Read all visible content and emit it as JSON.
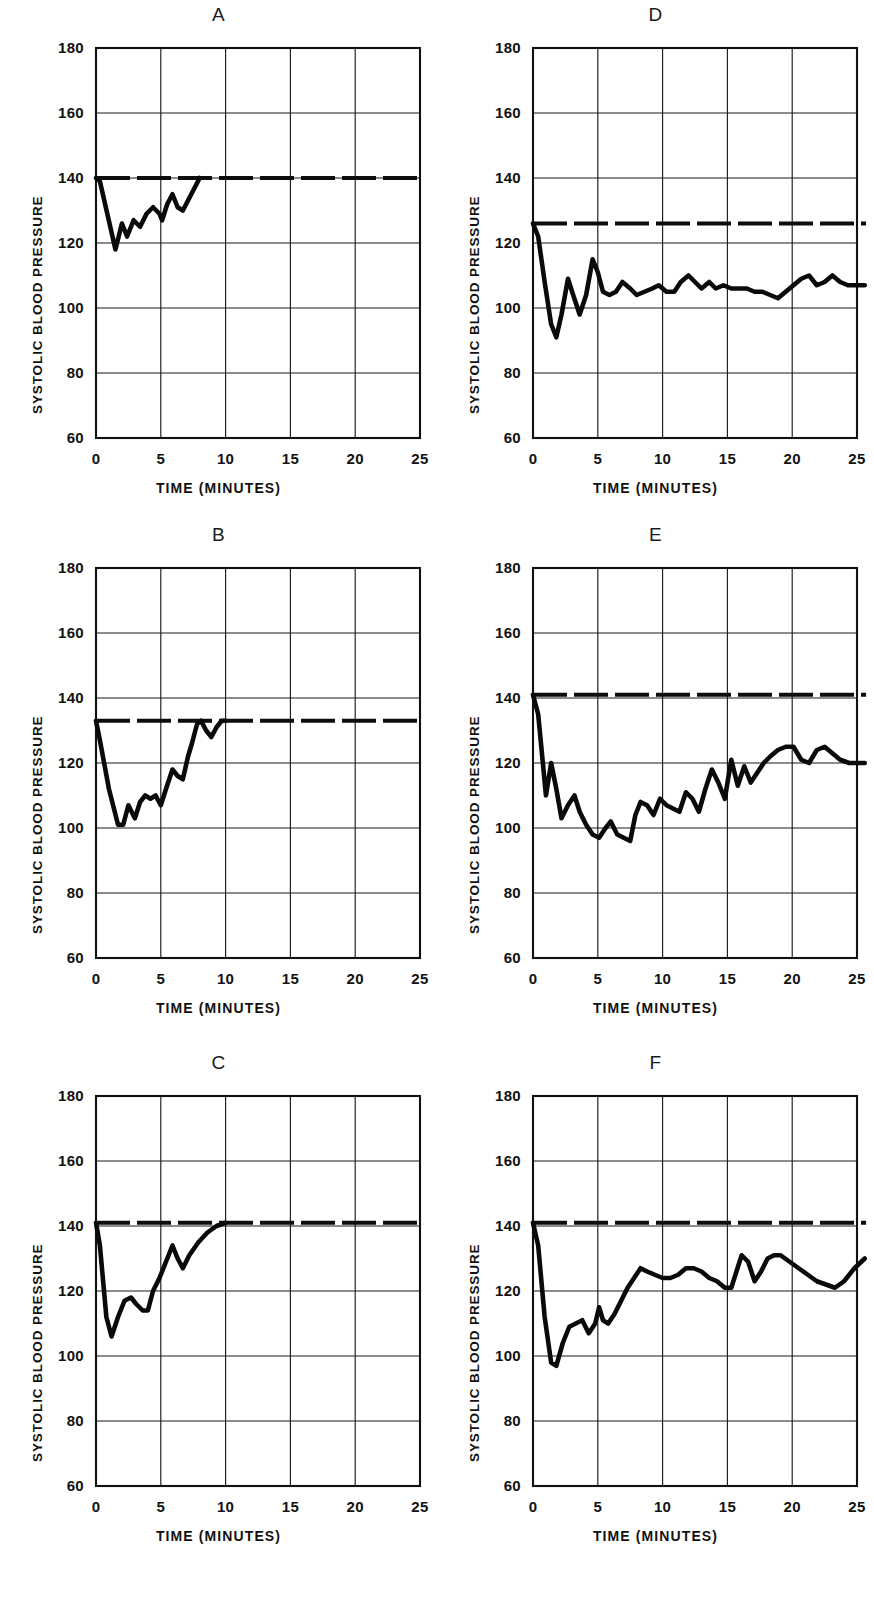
{
  "figure": {
    "title": "",
    "layout": "2 columns x 3 rows",
    "ylabel": "SYSTOLIC BLOOD PRESSURE",
    "xlabel": "TIME  (MINUTES)",
    "yticks": [
      "180",
      "160",
      "140",
      "120",
      "100",
      "80",
      "60"
    ],
    "xticks": [
      "0",
      "5",
      "10",
      "15",
      "20",
      "25"
    ],
    "line_color": "#0a0a0a",
    "grid_color": "#1b1b1b",
    "background": "#ffffff"
  },
  "panels": [
    {
      "id": "A",
      "label": "A",
      "position": "top-left"
    },
    {
      "id": "D",
      "label": "D",
      "position": "top-right"
    },
    {
      "id": "B",
      "label": "B",
      "position": "middle-left"
    },
    {
      "id": "E",
      "label": "E",
      "position": "middle-right"
    },
    {
      "id": "C",
      "label": "C",
      "position": "bottom-left"
    },
    {
      "id": "F",
      "label": "F",
      "position": "bottom-right"
    }
  ],
  "chart_data": [
    {
      "panel": "A",
      "type": "line",
      "title": "A",
      "xlabel": "TIME  (MINUTES)",
      "ylabel": "SYSTOLIC BLOOD PRESSURE",
      "xlim": [
        0,
        25
      ],
      "ylim": [
        60,
        180
      ],
      "xticks": [
        0,
        5,
        10,
        15,
        20,
        25
      ],
      "yticks": [
        60,
        80,
        100,
        120,
        140,
        160,
        180
      ],
      "grid": true,
      "legend": "none",
      "series": [
        {
          "name": "control reference (dashed)",
          "style": "dashed",
          "x": [
            0,
            25
          ],
          "values": [
            140,
            140
          ]
        },
        {
          "name": "systolic blood pressure (solid)",
          "style": "solid",
          "x": [
            0.0,
            0.3,
            1.5,
            2.0,
            2.4,
            2.9,
            3.4,
            3.9,
            4.4,
            4.9,
            5.1,
            5.5,
            5.9,
            6.3,
            6.7,
            8.0
          ],
          "values": [
            140,
            139,
            118,
            126,
            122,
            127,
            125,
            129,
            131,
            129,
            127,
            132,
            135,
            131,
            130,
            140
          ]
        }
      ]
    },
    {
      "panel": "D",
      "type": "line",
      "title": "D",
      "xlabel": "TIME  (MINUTES)",
      "ylabel": "SYSTOLIC BLOOD PRESSURE",
      "xlim": [
        0,
        25.7
      ],
      "ylim": [
        60,
        180
      ],
      "xticks": [
        0,
        5,
        10,
        15,
        20,
        25
      ],
      "yticks": [
        60,
        80,
        100,
        120,
        140,
        160,
        180
      ],
      "grid": true,
      "legend": "none",
      "series": [
        {
          "name": "control reference (dashed)",
          "style": "dashed",
          "x": [
            0,
            25.7
          ],
          "values": [
            126,
            126
          ]
        },
        {
          "name": "systolic blood pressure (solid)",
          "style": "solid",
          "x": [
            0.0,
            0.4,
            0.9,
            1.4,
            1.8,
            2.2,
            2.7,
            3.1,
            3.6,
            4.1,
            4.6,
            5.0,
            5.4,
            5.9,
            6.4,
            6.9,
            7.5,
            8.0,
            8.6,
            9.2,
            9.7,
            10.3,
            10.9,
            11.4,
            12.0,
            12.5,
            13.0,
            13.6,
            14.1,
            14.7,
            15.3,
            15.9,
            16.5,
            17.1,
            17.7,
            18.3,
            18.9,
            19.5,
            20.1,
            20.7,
            21.3,
            21.9,
            22.5,
            23.1,
            23.7,
            24.3,
            24.9,
            25.6
          ],
          "values": [
            126,
            122,
            108,
            95,
            91,
            98,
            109,
            104,
            98,
            104,
            115,
            111,
            105,
            104,
            105,
            108,
            106,
            104,
            105,
            106,
            107,
            105,
            105,
            108,
            110,
            108,
            106,
            108,
            106,
            107,
            106,
            106,
            106,
            105,
            105,
            104,
            103,
            105,
            107,
            109,
            110,
            107,
            108,
            110,
            108,
            107,
            107,
            107
          ]
        }
      ]
    },
    {
      "panel": "B",
      "type": "line",
      "title": "B",
      "xlabel": "TIME  (MINUTES)",
      "ylabel": "SYSTOLIC BLOOD PRESSURE",
      "xlim": [
        0,
        25
      ],
      "ylim": [
        60,
        180
      ],
      "xticks": [
        0,
        5,
        10,
        15,
        20,
        25
      ],
      "yticks": [
        60,
        80,
        100,
        120,
        140,
        160,
        180
      ],
      "grid": true,
      "legend": "none",
      "series": [
        {
          "name": "control reference (dashed)",
          "style": "dashed",
          "x": [
            0,
            25
          ],
          "values": [
            133,
            133
          ]
        },
        {
          "name": "systolic blood pressure (solid)",
          "style": "solid",
          "x": [
            0.0,
            0.3,
            1.0,
            1.7,
            2.1,
            2.5,
            3.0,
            3.4,
            3.8,
            4.2,
            4.6,
            5.0,
            5.4,
            5.9,
            6.3,
            6.7,
            7.1,
            7.4,
            7.8,
            8.1,
            8.5,
            8.9,
            9.3,
            9.7,
            10.0
          ],
          "values": [
            133,
            127,
            112,
            101,
            101,
            107,
            103,
            108,
            110,
            109,
            110,
            107,
            112,
            118,
            116,
            115,
            122,
            126,
            132,
            133,
            130,
            128,
            131,
            133,
            133
          ]
        }
      ]
    },
    {
      "panel": "E",
      "type": "line",
      "title": "E",
      "xlabel": "TIME  (MINUTES)",
      "ylabel": "SYSTOLIC BLOOD PRESSURE",
      "xlim": [
        0,
        25.7
      ],
      "ylim": [
        60,
        180
      ],
      "xticks": [
        0,
        5,
        10,
        15,
        20,
        25
      ],
      "yticks": [
        60,
        80,
        100,
        120,
        140,
        160,
        180
      ],
      "grid": true,
      "legend": "none",
      "series": [
        {
          "name": "control reference (dashed)",
          "style": "dashed",
          "x": [
            0,
            25.7
          ],
          "values": [
            141,
            141
          ]
        },
        {
          "name": "systolic blood pressure (solid)",
          "style": "solid",
          "x": [
            0.0,
            0.4,
            1.0,
            1.4,
            1.8,
            2.2,
            2.7,
            3.2,
            3.6,
            4.1,
            4.6,
            5.1,
            5.6,
            6.0,
            6.5,
            7.0,
            7.5,
            7.9,
            8.3,
            8.8,
            9.3,
            9.8,
            10.3,
            10.8,
            11.3,
            11.8,
            12.3,
            12.8,
            13.3,
            13.8,
            14.3,
            14.8,
            15.3,
            15.8,
            16.3,
            16.8,
            17.3,
            17.8,
            18.3,
            18.9,
            19.5,
            20.1,
            20.7,
            21.3,
            21.9,
            22.5,
            23.1,
            23.7,
            24.4,
            25.6
          ],
          "values": [
            141,
            135,
            110,
            120,
            112,
            103,
            107,
            110,
            105,
            101,
            98,
            97,
            100,
            102,
            98,
            97,
            96,
            104,
            108,
            107,
            104,
            109,
            107,
            106,
            105,
            111,
            109,
            105,
            112,
            118,
            114,
            109,
            121,
            113,
            119,
            114,
            117,
            120,
            122,
            124,
            125,
            125,
            121,
            120,
            124,
            125,
            123,
            121,
            120,
            120
          ]
        }
      ]
    },
    {
      "panel": "C",
      "type": "line",
      "title": "C",
      "xlabel": "TIME  (MINUTES)",
      "ylabel": "SYSTOLIC BLOOD PRESSURE",
      "xlim": [
        0,
        25
      ],
      "ylim": [
        60,
        180
      ],
      "xticks": [
        0,
        5,
        10,
        15,
        20,
        25
      ],
      "yticks": [
        60,
        80,
        100,
        120,
        140,
        160,
        180
      ],
      "grid": true,
      "legend": "none",
      "series": [
        {
          "name": "control reference (dashed)",
          "style": "dashed",
          "x": [
            0,
            25
          ],
          "values": [
            141,
            141
          ]
        },
        {
          "name": "systolic blood pressure (solid)",
          "style": "solid",
          "x": [
            0.0,
            0.3,
            0.8,
            1.2,
            1.7,
            2.2,
            2.7,
            3.1,
            3.6,
            4.0,
            4.4,
            4.9,
            5.4,
            5.9,
            6.3,
            6.7,
            7.2,
            7.9,
            8.6,
            9.3,
            10.0
          ],
          "values": [
            141,
            134,
            112,
            106,
            112,
            117,
            118,
            116,
            114,
            114,
            120,
            124,
            129,
            134,
            130,
            127,
            131,
            135,
            138,
            140,
            141
          ]
        }
      ]
    },
    {
      "panel": "F",
      "type": "line",
      "title": "F",
      "xlabel": "TIME  (MINUTES)",
      "ylabel": "SYSTOLIC BLOOD PRESSURE",
      "xlim": [
        0,
        25.7
      ],
      "ylim": [
        60,
        180
      ],
      "xticks": [
        0,
        5,
        10,
        15,
        20,
        25
      ],
      "yticks": [
        60,
        80,
        100,
        120,
        140,
        160,
        180
      ],
      "grid": true,
      "legend": "none",
      "series": [
        {
          "name": "control reference (dashed)",
          "style": "dashed",
          "x": [
            0,
            25.7
          ],
          "values": [
            141,
            141
          ]
        },
        {
          "name": "systolic blood pressure (solid)",
          "style": "solid",
          "x": [
            0.0,
            0.4,
            0.9,
            1.4,
            1.8,
            2.3,
            2.8,
            3.3,
            3.8,
            4.3,
            4.8,
            5.1,
            5.4,
            5.8,
            6.3,
            6.8,
            7.3,
            7.8,
            8.3,
            8.8,
            9.4,
            10.0,
            10.6,
            11.2,
            11.8,
            12.4,
            13.0,
            13.6,
            14.2,
            14.8,
            15.3,
            15.7,
            16.1,
            16.6,
            17.1,
            17.6,
            18.1,
            18.6,
            19.1,
            19.8,
            20.5,
            21.2,
            21.9,
            22.6,
            23.3,
            24.0,
            24.8,
            25.6
          ],
          "values": [
            141,
            134,
            112,
            98,
            97,
            104,
            109,
            110,
            111,
            107,
            110,
            115,
            111,
            110,
            113,
            117,
            121,
            124,
            127,
            126,
            125,
            124,
            124,
            125,
            127,
            127,
            126,
            124,
            123,
            121,
            121,
            126,
            131,
            129,
            123,
            126,
            130,
            131,
            131,
            129,
            127,
            125,
            123,
            122,
            121,
            123,
            127,
            130
          ]
        }
      ]
    }
  ]
}
